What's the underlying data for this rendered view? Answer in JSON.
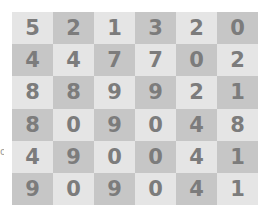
{
  "board": {
    "rows": 6,
    "cols": 6,
    "colors": {
      "light": "#e5e5e5",
      "dark": "#c6c6c6",
      "digit": "#7c7c7c"
    },
    "cells": [
      [
        "5",
        "2",
        "1",
        "3",
        "2",
        "0"
      ],
      [
        "4",
        "4",
        "7",
        "7",
        "0",
        "2"
      ],
      [
        "8",
        "8",
        "9",
        "9",
        "2",
        "1"
      ],
      [
        "8",
        "0",
        "9",
        "0",
        "4",
        "8"
      ],
      [
        "4",
        "9",
        "0",
        "0",
        "4",
        "1"
      ],
      [
        "9",
        "0",
        "9",
        "0",
        "4",
        "1"
      ]
    ]
  },
  "edge_mark": "o"
}
